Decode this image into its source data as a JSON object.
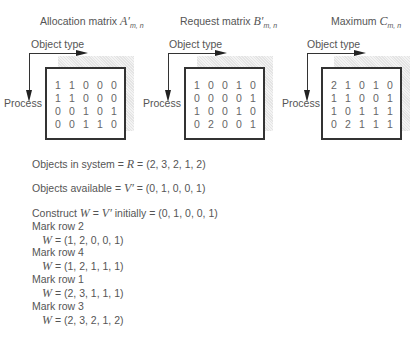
{
  "panels": [
    {
      "title_prefix": "Allocation matrix ",
      "title_symbol": "A′",
      "title_sub": "m, n",
      "object_type_label": "Object type",
      "process_label": "Process",
      "rows": [
        [
          "1",
          "1",
          "0",
          "0",
          "0"
        ],
        [
          "1",
          "1",
          "0",
          "0",
          "0"
        ],
        [
          "0",
          "0",
          "1",
          "0",
          "1"
        ],
        [
          "0",
          "0",
          "1",
          "1",
          "0"
        ]
      ]
    },
    {
      "title_prefix": "Request matrix ",
      "title_symbol": "B′",
      "title_sub": "m, n",
      "object_type_label": "Object type",
      "process_label": "Process",
      "rows": [
        [
          "1",
          "0",
          "0",
          "1",
          "0"
        ],
        [
          "0",
          "0",
          "0",
          "0",
          "1"
        ],
        [
          "1",
          "0",
          "0",
          "1",
          "0"
        ],
        [
          "0",
          "2",
          "0",
          "0",
          "1"
        ]
      ]
    },
    {
      "title_prefix": "Maximum ",
      "title_symbol": "C",
      "title_sub": "m, n",
      "object_type_label": "Object type",
      "process_label": "Process",
      "rows": [
        [
          "2",
          "1",
          "0",
          "1",
          "0"
        ],
        [
          "1",
          "1",
          "0",
          "0",
          "1"
        ],
        [
          "1",
          "0",
          "1",
          "1",
          "1"
        ],
        [
          "0",
          "2",
          "1",
          "1",
          "1"
        ]
      ]
    }
  ],
  "text": {
    "objects_in_system_prefix": "Objects in system = ",
    "objects_in_system_symbol": "R",
    "objects_in_system_value": " = (2, 3, 2, 1, 2)",
    "objects_available_prefix": "Objects available = ",
    "objects_available_symbol": "V′",
    "objects_available_value": " = (0, 1, 0, 0, 1)",
    "construct_prefix": "Construct ",
    "construct_w": "W",
    "construct_mid": " = ",
    "construct_v": "V′",
    "construct_suffix": " initially = (0, 1, 0, 0, 1)",
    "steps": [
      {
        "mark": "Mark row 2",
        "w": "W",
        "value": " = (1, 2, 0, 0, 1)"
      },
      {
        "mark": "Mark row 4",
        "w": "W",
        "value": " = (1, 2, 1, 1, 1)"
      },
      {
        "mark": "Mark row 1",
        "w": "W",
        "value": " = (2, 3, 1, 1, 1)"
      },
      {
        "mark": "Mark row 3",
        "w": "W",
        "value": " = (2, 3, 2, 1, 2)"
      }
    ]
  }
}
